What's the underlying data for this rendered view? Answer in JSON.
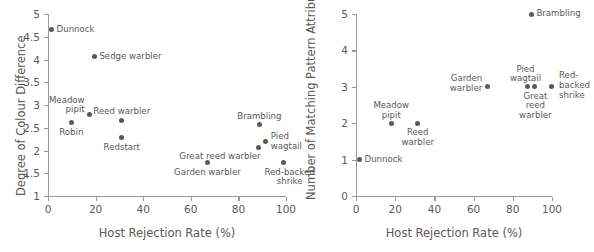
{
  "figure": {
    "background_color": "#ffffff",
    "ink_color": "#58595b",
    "axis_color": "#9a9b9d"
  },
  "chart_data": [
    {
      "type": "scatter",
      "panel": "left",
      "title": "",
      "xlabel": "Host Rejection Rate (%)",
      "ylabel": "Degree of Colour Difference",
      "xlim": [
        0,
        100
      ],
      "ylim": [
        1,
        5
      ],
      "xticks": [
        0,
        20,
        40,
        60,
        80,
        100
      ],
      "yticks": [
        1,
        1.5,
        2,
        2.5,
        3,
        3.5,
        4,
        4.5,
        5
      ],
      "xticklabels": [
        "0",
        "20",
        "40",
        "60",
        "80",
        "100"
      ],
      "yticklabels": [
        "1",
        "1.5",
        "2",
        "2.5",
        "3",
        "3.5",
        "4",
        "4.5",
        "5"
      ],
      "grid": false,
      "legend": "none",
      "points": [
        {
          "label": "Dunnock",
          "x": 1.5,
          "y": 4.65,
          "label_pos": "right",
          "label_lines": [
            "Dunnock"
          ]
        },
        {
          "label": "Sedge warbler",
          "x": 19.5,
          "y": 4.06,
          "label_pos": "right",
          "label_lines": [
            "Sedge warbler"
          ]
        },
        {
          "label": "Meadow pipit",
          "x": 17.5,
          "y": 2.8,
          "label_pos": "left-two",
          "label_lines": [
            "Meadow",
            "pipit"
          ]
        },
        {
          "label": "Robin",
          "x": 9.8,
          "y": 2.61,
          "label_pos": "below",
          "label_lines": [
            "Robin"
          ]
        },
        {
          "label": "Reed warbler",
          "x": 31.0,
          "y": 2.67,
          "label_pos": "above",
          "label_lines": [
            "Reed warbler"
          ]
        },
        {
          "label": "Redstart",
          "x": 31.0,
          "y": 2.28,
          "label_pos": "below",
          "label_lines": [
            "Redstart"
          ]
        },
        {
          "label": "Brambling",
          "x": 88.8,
          "y": 2.57,
          "label_pos": "above",
          "label_lines": [
            "Brambling"
          ]
        },
        {
          "label": "Pied wagtail",
          "x": 91.5,
          "y": 2.19,
          "label_pos": "right-two",
          "label_lines": [
            "Pied",
            "wagtail"
          ]
        },
        {
          "label": "Great reed warbler",
          "x": 88.5,
          "y": 2.07,
          "label_pos": "below-left",
          "label_lines": [
            "Great reed warbler"
          ]
        },
        {
          "label": "Garden warbler",
          "x": 67.0,
          "y": 1.73,
          "label_pos": "below",
          "label_lines": [
            "Garden warbler"
          ]
        },
        {
          "label": "Red-backed shrike",
          "x": 99.0,
          "y": 1.73,
          "label_pos": "below-two",
          "label_lines": [
            "Red-backed",
            "shrike"
          ]
        }
      ]
    },
    {
      "type": "scatter",
      "panel": "right",
      "title": "",
      "xlabel": "Host Rejection Rate (%)",
      "ylabel": "Number of Matching Pattern Attributes",
      "xlim": [
        0,
        100
      ],
      "ylim": [
        0,
        5
      ],
      "xticks": [
        0,
        20,
        40,
        60,
        80,
        100
      ],
      "yticks": [
        0,
        1,
        2,
        3,
        4,
        5
      ],
      "xticklabels": [
        "0",
        "20",
        "40",
        "60",
        "80",
        "100"
      ],
      "yticklabels": [
        "0",
        "1",
        "2",
        "3",
        "4",
        "5"
      ],
      "grid": false,
      "legend": "none",
      "points": [
        {
          "label": "Brambling",
          "x": 89.5,
          "y": 5,
          "label_pos": "right",
          "label_lines": [
            "Brambling"
          ]
        },
        {
          "label": "Dunnock",
          "x": 1.8,
          "y": 1,
          "label_pos": "right",
          "label_lines": [
            "Dunnock"
          ]
        },
        {
          "label": "Meadow pipit",
          "x": 18.0,
          "y": 2,
          "label_pos": "above-two",
          "label_lines": [
            "Meadow",
            "pipit"
          ]
        },
        {
          "label": "Reed warbler",
          "x": 31.5,
          "y": 2,
          "label_pos": "below-two",
          "label_lines": [
            "Reed",
            "warbler"
          ]
        },
        {
          "label": "Garden warbler",
          "x": 67.0,
          "y": 3,
          "label_pos": "left-two",
          "label_lines": [
            "Garden",
            "warbler"
          ]
        },
        {
          "label": "Pied wagtail",
          "x": 87.5,
          "y": 3,
          "label_pos": "above-two",
          "label_lines": [
            "Pied",
            "wagtail"
          ]
        },
        {
          "label": "Great reed warbler",
          "x": 91.0,
          "y": 3,
          "label_pos": "below-three",
          "label_lines": [
            "Great",
            "reed",
            "warbler"
          ]
        },
        {
          "label": "Red-backed shrike",
          "x": 99.5,
          "y": 3,
          "label_pos": "right-three",
          "label_lines": [
            "Red-",
            "backed",
            "shrike"
          ]
        }
      ]
    }
  ]
}
